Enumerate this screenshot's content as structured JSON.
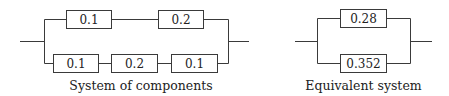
{
  "diagrams": [
    {
      "caption": "System of components",
      "top_branch": [
        "0.1",
        "0.2"
      ],
      "bottom_branch": [
        "0.1",
        "0.2",
        "0.1"
      ]
    },
    {
      "caption": "Equivalent system",
      "top_branch": [
        "0.28"
      ],
      "bottom_branch": [
        "0.352"
      ]
    }
  ],
  "colors": {
    "line": "#3a3a3a",
    "text": "#222222",
    "background": "#ffffff"
  }
}
